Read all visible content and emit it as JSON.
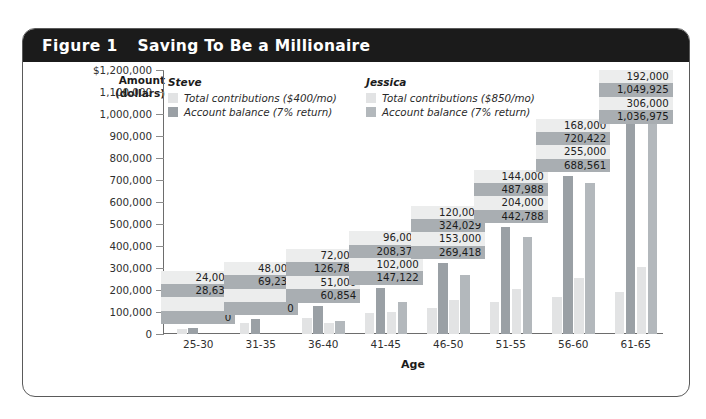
{
  "figure": {
    "number": "Figure 1",
    "title": "Saving To Be a Millionaire"
  },
  "legend": {
    "steve": {
      "name": "Steve",
      "contributions_label": "Total contributions ($400/mo)",
      "balance_label": "Account balance (7% return)",
      "contributions_color": "#e2e3e4",
      "balance_color": "#9aa0a5"
    },
    "jessica": {
      "name": "Jessica",
      "contributions_label": "Total contributions ($850/mo)",
      "balance_label": "Account balance (7% return)",
      "contributions_color": "#e2e3e4",
      "balance_color": "#b3b8bc"
    }
  },
  "chart_data": {
    "type": "bar",
    "title": "Saving To Be a Millionaire",
    "xlabel": "Age",
    "ylabel": "Amount\n(dollars)",
    "ylabel_line1": "Amount",
    "ylabel_line2": "(dollars)",
    "ylim": [
      0,
      1200000
    ],
    "ytick_step": 100000,
    "grid": false,
    "legend_position": "top",
    "ytick_labels": [
      "$1,200,000",
      "1,100,000",
      "1,000,000",
      "900,000",
      "800,000",
      "700,000",
      "600,000",
      "500,000",
      "400,000",
      "300,000",
      "200,000",
      "100,000",
      "0"
    ],
    "ytick_values": [
      1200000,
      1100000,
      1000000,
      900000,
      800000,
      700000,
      600000,
      500000,
      400000,
      300000,
      200000,
      100000,
      0
    ],
    "categories": [
      "25-30",
      "31-35",
      "36-40",
      "41-45",
      "46-50",
      "51-55",
      "56-60",
      "61-65"
    ],
    "series": [
      {
        "name": "Steve total contributions ($400/mo)",
        "key": "steve_contrib",
        "color": "#e2e3e4",
        "values": [
          24000,
          48000,
          72000,
          96000,
          120000,
          144000,
          168000,
          192000
        ],
        "labels": [
          "24,000",
          "48,000",
          "72,000",
          "96,000",
          "120,000",
          "144,000",
          "168,000",
          "192,000"
        ]
      },
      {
        "name": "Steve account balance (7% return)",
        "key": "steve_balance",
        "color": "#9aa0a5",
        "values": [
          28637,
          69234,
          126785,
          208371,
          324029,
          487988,
          720422,
          1049925
        ],
        "labels": [
          "28,637",
          "69,234",
          "126,785",
          "208,371",
          "324,029",
          "487,988",
          "720,422",
          "1,049,925"
        ]
      },
      {
        "name": "Jessica total contributions ($850/mo)",
        "key": "jess_contrib",
        "color": "#e2e3e4",
        "values": [
          0,
          0,
          51000,
          102000,
          153000,
          204000,
          255000,
          306000
        ],
        "labels": [
          "0",
          "0",
          "51,000",
          "102,000",
          "153,000",
          "204,000",
          "255,000",
          "306,000"
        ]
      },
      {
        "name": "Jessica account balance (7% return)",
        "key": "jess_balance",
        "color": "#b3b8bc",
        "values": [
          0,
          0,
          60854,
          147122,
          269418,
          442788,
          688561,
          1036975
        ],
        "labels": [
          "0",
          "0",
          "60,854",
          "147,122",
          "269,418",
          "442,788",
          "688,561",
          "1,036,975"
        ]
      }
    ]
  }
}
